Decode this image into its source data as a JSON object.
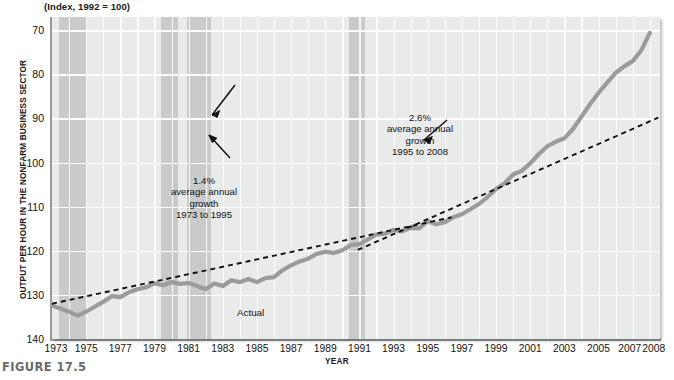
{
  "figure": {
    "caption": "FIGURE 17.5",
    "title": "(Index, 1992 = 100)"
  },
  "axes": {
    "ylabel": "OUTPUT PER HOUR IN THE NONFARM BUSINESS SECTOR",
    "xlabel": "YEAR",
    "yticks": [
      "140",
      "130",
      "120",
      "110",
      "100",
      "90",
      "80",
      "70"
    ],
    "xticks": [
      "1973",
      "1975",
      "1977",
      "1979",
      "1981",
      "1983",
      "1985",
      "1987",
      "1989",
      "1991",
      "1993",
      "1995",
      "1997",
      "1999",
      "2001",
      "2003",
      "2005",
      "2007",
      "2008"
    ]
  },
  "annotations": {
    "trend1": {
      "rate": "1.4%",
      "line2": "average annual",
      "line3": "growth",
      "line4": "1973 to 1995"
    },
    "trend2": {
      "rate": "2.6%",
      "line2": "average annual",
      "line3": "growth",
      "line4": "1995 to 2008"
    },
    "actual": "Actual"
  },
  "colors": {
    "plot_background": "#e9eaea",
    "recession_band": "#c9cbcb",
    "gridline": "#ffffff",
    "actual_line": "#9a9c9c",
    "trend_line": "#111111",
    "caption": "#6b6b6b"
  },
  "chart_data": {
    "type": "line",
    "title": "(Index, 1992 = 100)",
    "xlabel": "YEAR",
    "ylabel": "OUTPUT PER HOUR IN THE NONFARM BUSINESS SECTOR",
    "xlim": [
      1973,
      2008.6
    ],
    "ylim": [
      70,
      143
    ],
    "yticks": [
      70,
      80,
      90,
      100,
      110,
      120,
      130,
      140
    ],
    "xticks": [
      1973,
      1975,
      1977,
      1979,
      1981,
      1983,
      1985,
      1987,
      1989,
      1991,
      1993,
      1995,
      1997,
      1999,
      2001,
      2003,
      2005,
      2007,
      2008
    ],
    "grid": true,
    "legend": false,
    "series": [
      {
        "name": "Actual",
        "x": [
          1973.0,
          1973.5,
          1974.0,
          1974.5,
          1975.0,
          1975.5,
          1976.0,
          1976.5,
          1977.0,
          1977.5,
          1978.0,
          1978.5,
          1979.0,
          1979.5,
          1980.0,
          1980.5,
          1981.0,
          1981.5,
          1982.0,
          1982.5,
          1983.0,
          1983.5,
          1984.0,
          1984.5,
          1985.0,
          1985.5,
          1986.0,
          1986.5,
          1987.0,
          1987.5,
          1988.0,
          1988.5,
          1989.0,
          1989.5,
          1990.0,
          1990.5,
          1991.0,
          1991.5,
          1992.0,
          1992.5,
          1993.0,
          1993.5,
          1994.0,
          1994.5,
          1995.0,
          1995.5,
          1996.0,
          1996.5,
          1997.0,
          1997.5,
          1998.0,
          1998.5,
          1999.0,
          1999.5,
          2000.0,
          2000.5,
          2001.0,
          2001.5,
          2002.0,
          2002.5,
          2003.0,
          2003.5,
          2004.0,
          2004.5,
          2005.0,
          2005.5,
          2006.0,
          2006.5,
          2007.0,
          2007.5,
          2008.0
        ],
        "y": [
          77.6,
          76.9,
          76.2,
          75.3,
          76.2,
          77.3,
          78.4,
          79.7,
          79.5,
          80.6,
          81.3,
          81.7,
          82.6,
          82.2,
          82.9,
          82.5,
          82.7,
          82.0,
          81.3,
          82.6,
          82.0,
          83.3,
          82.9,
          83.6,
          82.9,
          83.8,
          84.0,
          85.6,
          86.7,
          87.6,
          88.2,
          89.3,
          89.8,
          89.5,
          90.1,
          91.3,
          91.5,
          92.6,
          93.7,
          93.9,
          94.7,
          94.4,
          95.2,
          95.1,
          96.7,
          96.0,
          96.5,
          97.6,
          98.3,
          99.4,
          100.6,
          102.2,
          104.0,
          105.3,
          107.3,
          108.1,
          109.8,
          111.9,
          113.7,
          114.7,
          115.5,
          117.6,
          120.4,
          123.2,
          125.8,
          128.1,
          130.3,
          131.8,
          133.0,
          135.4,
          139.4
        ]
      }
    ],
    "trend_lines": [
      {
        "name": "1.4% average annual growth 1973 to 1995",
        "rate_pct": 1.4,
        "x": [
          1973,
          1996.4
        ],
        "y": [
          78.0,
          97.6
        ]
      },
      {
        "name": "2.6% average annual growth 1995 to 2008",
        "rate_pct": 2.6,
        "x": [
          1990.9,
          2008.5
        ],
        "y": [
          90.2,
          120.2
        ]
      }
    ],
    "shaded_bands": [
      {
        "label": "recession",
        "x0": 1973.4,
        "x1": 1975.0
      },
      {
        "label": "recession",
        "x0": 1979.4,
        "x1": 1980.4
      },
      {
        "label": "recession",
        "x0": 1980.9,
        "x1": 1982.3
      },
      {
        "label": "recession",
        "x0": 1990.4,
        "x1": 1991.3
      }
    ]
  }
}
